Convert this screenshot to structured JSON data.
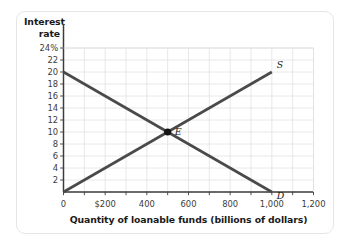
{
  "figure": {
    "y_axis_title": "Interest\nrate",
    "y_axis_title_line1": "Interest",
    "y_axis_title_line2": "rate",
    "x_axis_title": "Quantity of loanable funds (billions of dollars)"
  },
  "chart_data": {
    "type": "line",
    "title": "",
    "xlabel": "Quantity of loanable funds (billions of dollars)",
    "ylabel": "Interest rate",
    "xlim": [
      0,
      1200
    ],
    "ylim": [
      0,
      24
    ],
    "grid": true,
    "legend_position": "inline-curve-end",
    "x_ticks": [
      0,
      200,
      400,
      600,
      800,
      1000,
      1200
    ],
    "x_tick_labels": [
      "0",
      "$200",
      "400",
      "600",
      "800",
      "1,000",
      "1,200"
    ],
    "y_ticks": [
      2,
      4,
      6,
      8,
      10,
      12,
      14,
      16,
      18,
      20,
      22,
      24
    ],
    "y_tick_labels": [
      "2",
      "4",
      "6",
      "8",
      "10",
      "12",
      "14",
      "16",
      "18",
      "20",
      "22",
      "24%"
    ],
    "x_minor_step": 100,
    "y_minor_step": 2,
    "series": [
      {
        "name": "S",
        "label": "S",
        "description": "Supply of loanable funds",
        "color": "#4a4a4a",
        "points": [
          [
            0,
            0
          ],
          [
            1000,
            20
          ]
        ]
      },
      {
        "name": "D",
        "label": "D",
        "description": "Demand for loanable funds",
        "color": "#4a4a4a",
        "points": [
          [
            0,
            20
          ],
          [
            1000,
            0
          ]
        ]
      }
    ],
    "annotations": [
      {
        "name": "equilibrium",
        "label": "E",
        "x": 500,
        "y": 10,
        "marker": "filled-circle",
        "color": "#141414"
      }
    ]
  },
  "colors": {
    "curve": "#4a4a4a",
    "axis": "#3c3c3c",
    "grid": "#e2e2e2",
    "marker": "#141414",
    "card_border": "#e6e6e6",
    "background": "#ffffff"
  }
}
